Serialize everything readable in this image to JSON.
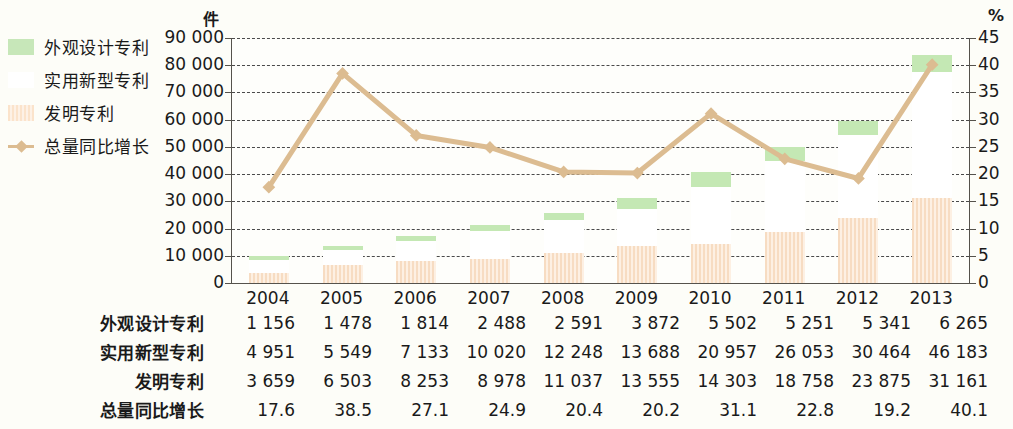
{
  "axis": {
    "left_unit": "件",
    "right_unit": "%",
    "left_ticks": [
      "90 000",
      "80 000",
      "70 000",
      "60 000",
      "50 000",
      "40 000",
      "30 000",
      "20 000",
      "10 000",
      "0"
    ],
    "right_ticks": [
      "45",
      "40",
      "35",
      "30",
      "25",
      "20",
      "15",
      "10",
      "5",
      "0"
    ]
  },
  "legend": {
    "items": [
      {
        "label": "外观设计专利",
        "marker": "green-square-swatch",
        "color": "#c4e8b4"
      },
      {
        "label": "实用新型专利",
        "marker": "white-square-swatch",
        "color": "#ffffff"
      },
      {
        "label": "发明专利",
        "marker": "peach-striped-square-swatch",
        "color": "#f7dcc2"
      },
      {
        "label": "总量同比增长",
        "marker": "line-diamond-marker",
        "color": "#dcbc91"
      }
    ]
  },
  "table": {
    "rows": [
      {
        "label": "外观设计专利",
        "values": [
          "1 156",
          "1 478",
          "1 814",
          "2 488",
          "2 591",
          "3 872",
          "5 502",
          "5 251",
          "5 341",
          "6 265"
        ]
      },
      {
        "label": "实用新型专利",
        "values": [
          "4 951",
          "5 549",
          "7 133",
          "10 020",
          "12 248",
          "13 688",
          "20 957",
          "26 053",
          "30 464",
          "46 183"
        ]
      },
      {
        "label": "发明专利",
        "values": [
          "3 659",
          "6 503",
          "8 253",
          "8 978",
          "11 037",
          "13 555",
          "14 303",
          "18 758",
          "23 875",
          "31 161"
        ]
      },
      {
        "label": "总量同比增长",
        "values": [
          "17.6",
          "38.5",
          "27.1",
          "24.9",
          "20.4",
          "20.2",
          "31.1",
          "22.8",
          "19.2",
          "40.1"
        ]
      }
    ]
  },
  "chart_data": {
    "type": "bar",
    "title": "",
    "xlabel": "",
    "ylabel": "件",
    "y2label": "%",
    "ylim": [
      0,
      90000
    ],
    "y2lim": [
      0,
      45
    ],
    "grid": true,
    "legend_position": "left-outside",
    "categories": [
      "2004",
      "2005",
      "2006",
      "2007",
      "2008",
      "2009",
      "2010",
      "2011",
      "2012",
      "2013"
    ],
    "series": [
      {
        "name": "发明专利",
        "type": "bar-stack",
        "stack_order": 1,
        "color": "#f7dcc2",
        "values": [
          3659,
          6503,
          8253,
          8978,
          11037,
          13555,
          14303,
          18758,
          23875,
          31161
        ]
      },
      {
        "name": "实用新型专利",
        "type": "bar-stack",
        "stack_order": 2,
        "color": "#ffffff",
        "values": [
          4951,
          5549,
          7133,
          10020,
          12248,
          13688,
          20957,
          26053,
          30464,
          46183
        ]
      },
      {
        "name": "外观设计专利",
        "type": "bar-stack",
        "stack_order": 3,
        "color": "#c4e8b4",
        "values": [
          1156,
          1478,
          1814,
          2488,
          2591,
          3872,
          5502,
          5251,
          5341,
          6265
        ]
      },
      {
        "name": "总量同比增长",
        "type": "line",
        "axis": "right",
        "color": "#dcbc91",
        "values": [
          17.6,
          38.5,
          27.1,
          24.9,
          20.4,
          20.2,
          31.1,
          22.8,
          19.2,
          40.1
        ]
      }
    ]
  }
}
